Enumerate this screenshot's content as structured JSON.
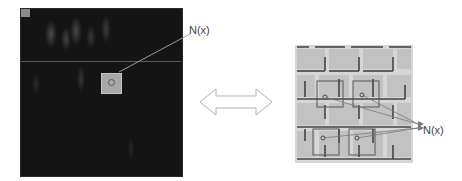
{
  "figure": {
    "left_panel": {
      "description": "dark noisy image with highlighted neighborhood patch",
      "label": "N(x)"
    },
    "connector": {
      "icon": "double-arrow-icon"
    },
    "right_panel": {
      "description": "textured brick-like image with similar neighborhood patches",
      "label": "N(x)",
      "patch_count": 4
    }
  }
}
